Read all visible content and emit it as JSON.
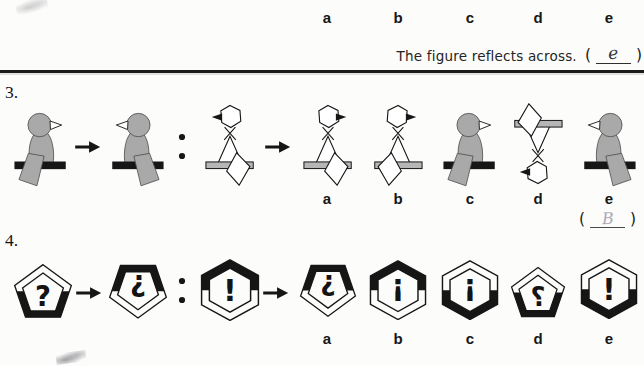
{
  "header": {
    "option_labels": [
      "a",
      "b",
      "c",
      "d",
      "e"
    ],
    "instruction_text": "The figure reflects across.",
    "answer": {
      "open": "(",
      "value": "e",
      "close": ")"
    }
  },
  "q3": {
    "number": "3.",
    "pair": [
      {
        "name": "gray-bird-facing-right"
      },
      {
        "name": "gray-bird-facing-left"
      },
      {
        "name": "white-outline-bird-facing-left"
      }
    ],
    "options": [
      {
        "label": "a",
        "name": "outline-bird-beak-right-tail-right"
      },
      {
        "label": "b",
        "name": "outline-bird-facing-right"
      },
      {
        "label": "c",
        "name": "gray-bird-facing-right"
      },
      {
        "label": "d",
        "name": "outline-bird-rotated-180"
      },
      {
        "label": "e",
        "name": "gray-bird-facing-left"
      }
    ],
    "answer": {
      "open": "(",
      "value": "B",
      "close": ")"
    }
  },
  "q4": {
    "number": "4.",
    "pair": [
      {
        "name": "pentagon-band-bottom-question",
        "glyph": "?"
      },
      {
        "name": "pentagon-rotated-band-top-question",
        "glyph": "¿"
      },
      {
        "name": "hexagon-band-top-exclaim",
        "glyph": "!"
      }
    ],
    "options": [
      {
        "label": "a",
        "name": "pentagon-rotated-band-top-question",
        "glyph": "¿"
      },
      {
        "label": "b",
        "name": "hexagon-band-top-exclaim-rotated",
        "glyph": "¡"
      },
      {
        "label": "c",
        "name": "hexagon-band-bottom-exclaim-rotated",
        "glyph": "¡"
      },
      {
        "label": "d",
        "name": "pentagon-band-bottom-question-mirrored",
        "glyph": "?",
        "mirrored": true
      },
      {
        "label": "e",
        "name": "hexagon-band-bottom-exclaim",
        "glyph": "!"
      }
    ]
  },
  "colors": {
    "figure_gray": "#a9a9a9",
    "bar_black": "#161616",
    "bar_gray": "#b6b6b6",
    "ink": "#161616",
    "pencil_dark": "#33333d",
    "pencil_light": "#a9a9b6"
  }
}
